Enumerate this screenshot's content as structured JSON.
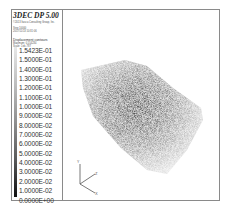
{
  "header": {
    "title": "3DEC  DP 5.00",
    "company": "©2013 Itasca Consulting Group, Inc.",
    "step": "Step 10000",
    "datetime": "2017/11/13 10:31:06"
  },
  "contour": {
    "label": "Displacement contours",
    "max_line": "Maximum: 0.154234",
    "scale_line": "Scale: 1:dc.787"
  },
  "legend_values": [
    "1.5423E-01",
    "1.5000E-01",
    "1.4000E-01",
    "1.3000E-01",
    "1.2000E-01",
    "1.1000E-01",
    "1.0000E-01",
    "9.0000E-02",
    "8.0000E-02",
    "7.0000E-02",
    "6.0000E-02",
    "5.0000E-02",
    "4.0000E-02",
    "3.0000E-02",
    "2.0000E-02",
    "1.0000E-02",
    "0.0000E+00"
  ],
  "axes": {
    "y": "Y",
    "z": "Z",
    "x": "X"
  },
  "colors": {
    "frame": "#8a8a8a",
    "max": "#e8e8e8",
    "min": "#111111"
  }
}
